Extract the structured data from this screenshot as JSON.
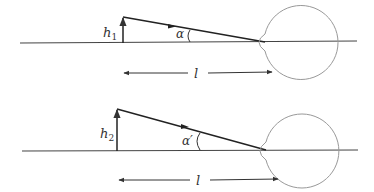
{
  "diagram": {
    "colors": {
      "line": "#333333",
      "eye": "#999999",
      "background": "#ffffff"
    },
    "panels": [
      {
        "id": "top",
        "height_label": "h",
        "height_sub": "1",
        "angle_label": "α",
        "distance_label": "l",
        "geometry": {
          "baseline_y": 43,
          "object_x": 123,
          "object_top_y": 17,
          "eye_center_x": 296,
          "eye_center_y": 42,
          "eye_r": 37,
          "vertex_x": 265
        }
      },
      {
        "id": "bottom",
        "height_label": "h",
        "height_sub": "2",
        "angle_label": "α′",
        "distance_label": "l",
        "geometry": {
          "baseline_y": 151,
          "object_x": 117,
          "object_top_y": 109,
          "eye_center_x": 297,
          "eye_center_y": 151,
          "eye_r": 37,
          "vertex_x": 266
        }
      }
    ]
  }
}
